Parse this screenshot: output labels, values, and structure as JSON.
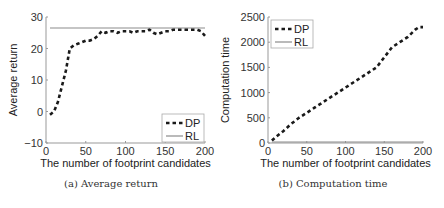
{
  "chart_data": [
    {
      "type": "line",
      "title": "",
      "caption": "(a)  Average return",
      "xlabel": "The number of footprint candidates",
      "ylabel": "Average return",
      "xlim": [
        0,
        200
      ],
      "ylim": [
        -10,
        30
      ],
      "xticks": [
        0,
        50,
        100,
        150,
        200
      ],
      "yticks": [
        -10,
        0,
        10,
        20,
        30
      ],
      "grid": false,
      "legend_position": "lower right",
      "series": [
        {
          "name": "DP",
          "style": "dashed",
          "x": [
            5,
            10,
            15,
            20,
            25,
            30,
            35,
            40,
            45,
            50,
            55,
            60,
            65,
            70,
            75,
            80,
            85,
            90,
            95,
            100,
            105,
            110,
            115,
            120,
            125,
            130,
            135,
            140,
            145,
            150,
            155,
            160,
            165,
            170,
            175,
            180,
            185,
            190,
            195,
            200
          ],
          "values": [
            -1,
            0,
            3,
            8,
            13,
            20,
            21,
            21.5,
            22,
            22.5,
            22.5,
            23,
            24,
            25.5,
            25,
            25.5,
            25.5,
            25,
            25.5,
            25.5,
            25.5,
            25,
            25.5,
            25.5,
            25.5,
            26,
            25,
            24.5,
            25,
            25.5,
            25.5,
            26,
            26,
            26,
            26,
            26,
            26,
            26,
            25.5,
            24
          ]
        },
        {
          "name": "RL",
          "style": "solid",
          "x": [
            5,
            200
          ],
          "values": [
            26.5,
            26.5
          ]
        }
      ]
    },
    {
      "type": "line",
      "title": "",
      "caption": "(b)  Computation time",
      "xlabel": "The number of footprint candidates",
      "ylabel": "Computation time",
      "xlim": [
        0,
        200
      ],
      "ylim": [
        0,
        2500
      ],
      "xticks": [
        0,
        50,
        100,
        150,
        200
      ],
      "yticks": [
        0,
        500,
        1000,
        1500,
        2000,
        2500
      ],
      "grid": false,
      "legend_position": "upper left",
      "series": [
        {
          "name": "DP",
          "style": "dashed",
          "x": [
            5,
            10,
            20,
            30,
            40,
            50,
            60,
            70,
            80,
            90,
            100,
            110,
            120,
            130,
            140,
            150,
            160,
            170,
            180,
            190,
            195,
            200
          ],
          "values": [
            50,
            120,
            240,
            380,
            500,
            600,
            700,
            800,
            900,
            1000,
            1100,
            1200,
            1300,
            1400,
            1500,
            1700,
            1900,
            2000,
            2100,
            2250,
            2300,
            2300
          ]
        },
        {
          "name": "RL",
          "style": "solid",
          "x": [
            5,
            200
          ],
          "values": [
            20,
            20
          ]
        }
      ]
    }
  ],
  "legend": {
    "dp_label": "DP",
    "rl_label": "RL"
  },
  "colors": {
    "dp": "#1a1a1a",
    "rl": "#8c8c8c",
    "axis": "#999999"
  }
}
